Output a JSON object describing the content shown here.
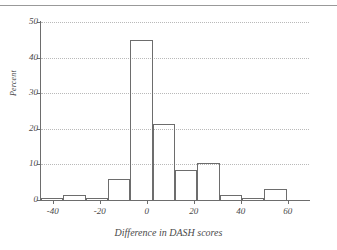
{
  "figure": {
    "top_rule_color": "#999999",
    "axis_color": "#6d6d6d",
    "grid_color": "#b9b9b9",
    "bar_edge_color": "#6d6d6d",
    "bar_fill": "none"
  },
  "chart_data": {
    "type": "bar",
    "title": "",
    "subtitle": "",
    "xlabel": "Difference in DASH scores",
    "ylabel": "Percent",
    "xlim": [
      -45,
      69
    ],
    "ylim": [
      0,
      50
    ],
    "grid": true,
    "legend": null,
    "bin_width": 9.5,
    "x_ticks": [
      -40,
      -20,
      0,
      20,
      40,
      60
    ],
    "x_tick_labels": [
      "-40",
      "-20",
      "0",
      "20",
      "40",
      "60"
    ],
    "y_ticks": [
      0,
      10,
      20,
      30,
      40,
      50
    ],
    "y_tick_labels": [
      "0",
      "10",
      "20",
      "30",
      "40",
      "50"
    ],
    "bins": [
      {
        "left": -45.0,
        "right": -35.5,
        "center": -40.25,
        "value": 0.7
      },
      {
        "left": -35.5,
        "right": -26.0,
        "center": -30.75,
        "value": 1.4
      },
      {
        "left": -26.0,
        "right": -16.5,
        "center": -21.25,
        "value": 0.7
      },
      {
        "left": -16.5,
        "right": -7.0,
        "center": -11.75,
        "value": 6.0
      },
      {
        "left": -7.0,
        "right": 2.5,
        "center": -2.25,
        "value": 45.0
      },
      {
        "left": 2.5,
        "right": 12.0,
        "center": 7.25,
        "value": 21.3
      },
      {
        "left": 12.0,
        "right": 21.5,
        "center": 16.75,
        "value": 8.5
      },
      {
        "left": 21.5,
        "right": 31.0,
        "center": 26.25,
        "value": 10.5
      },
      {
        "left": 31.0,
        "right": 40.5,
        "center": 35.75,
        "value": 1.4
      },
      {
        "left": 40.5,
        "right": 50.0,
        "center": 45.25,
        "value": 0.7
      },
      {
        "left": 50.0,
        "right": 59.5,
        "center": 54.75,
        "value": 3.2
      }
    ]
  }
}
